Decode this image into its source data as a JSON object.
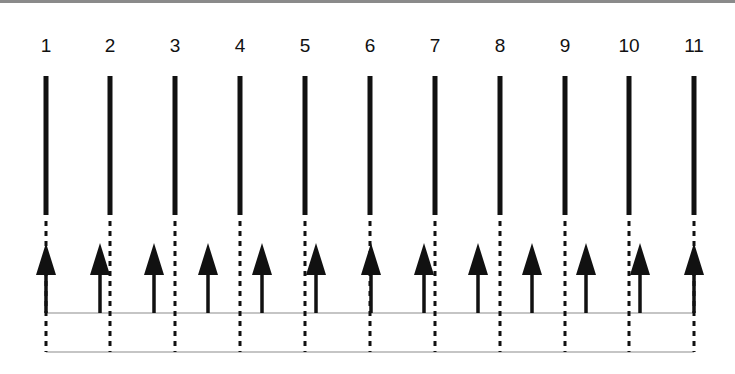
{
  "diagram": {
    "line_labels": [
      "1",
      "2",
      "3",
      "4",
      "5",
      "6",
      "7",
      "8",
      "9",
      "10",
      "11"
    ],
    "line_x": [
      46,
      110,
      175,
      240,
      305,
      370,
      435,
      500,
      565,
      629,
      694
    ],
    "arrow_x": [
      46,
      100,
      154,
      208,
      262,
      316,
      371,
      424,
      478,
      532,
      586,
      640,
      694
    ],
    "arrow_count": 13,
    "solid_top_y": 76,
    "solid_bottom_y": 215,
    "dashed_bottom_y": 352,
    "arrow_tip_y": 243,
    "arrow_head_base_y": 275,
    "baseline_y": 313,
    "bottom_line_y": 352,
    "colors": {
      "stroke": "#111111",
      "thin_line": "#8c8c8c",
      "top_bar": "#8a8a8a"
    }
  }
}
